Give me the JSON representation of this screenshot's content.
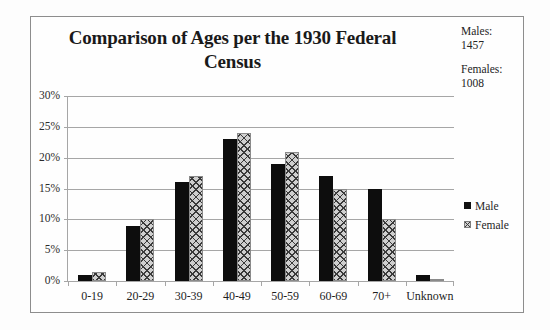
{
  "chart_data": {
    "type": "bar",
    "title": "Comparison of Ages per the 1930 Federal Census",
    "xlabel": "",
    "ylabel": "",
    "ylim": [
      0,
      30
    ],
    "ytick_labels": [
      "0%",
      "5%",
      "10%",
      "15%",
      "20%",
      "25%",
      "30%"
    ],
    "ytick_values": [
      0,
      5,
      10,
      15,
      20,
      25,
      30
    ],
    "grid": true,
    "legend_position": "right",
    "categories": [
      "0-19",
      "20-29",
      "30-39",
      "40-49",
      "50-59",
      "60-69",
      "70+",
      "Unknown"
    ],
    "series": [
      {
        "name": "Male",
        "values": [
          1,
          9,
          16,
          23,
          19,
          17,
          15,
          1
        ]
      },
      {
        "name": "Female",
        "values": [
          1.5,
          10,
          17,
          24,
          21,
          15,
          10,
          0.3
        ]
      }
    ]
  },
  "annotations": {
    "males_label": "Males:",
    "males_value": "1457",
    "females_label": "Females:",
    "females_value": "1008"
  },
  "colors": {
    "male_fill": "#0d0d0d",
    "female_fill": "#cfcfcf",
    "gridline": "#a6a6a6",
    "frame_border": "#8d8d8d",
    "text": "#1f1f1f"
  }
}
